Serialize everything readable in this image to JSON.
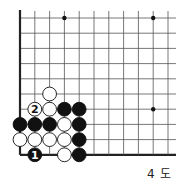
{
  "diagram": {
    "caption": "4 도",
    "board": {
      "columns": 11,
      "rows": 10,
      "origin_x": 20,
      "origin_y": 18,
      "step_x": 14.8,
      "step_y": 15.2,
      "left_edge": true,
      "bottom_edge": true,
      "line_color": "#555555",
      "edge_color": "#222222"
    },
    "hoshi": [
      {
        "col": 3,
        "row": 0
      },
      {
        "col": 9,
        "row": 0
      },
      {
        "col": 9,
        "row": 6
      }
    ],
    "stones": [
      {
        "color": "white",
        "col": 2,
        "row": 5,
        "label": ""
      },
      {
        "color": "white",
        "col": 1,
        "row": 6,
        "label": "2"
      },
      {
        "color": "white",
        "col": 2,
        "row": 6,
        "label": ""
      },
      {
        "color": "black",
        "col": 3,
        "row": 6,
        "label": ""
      },
      {
        "color": "black",
        "col": 4,
        "row": 6,
        "label": ""
      },
      {
        "color": "black",
        "col": 0,
        "row": 7,
        "label": ""
      },
      {
        "color": "black",
        "col": 1,
        "row": 7,
        "label": ""
      },
      {
        "color": "black",
        "col": 2,
        "row": 7,
        "label": ""
      },
      {
        "color": "white",
        "col": 3,
        "row": 7,
        "label": ""
      },
      {
        "color": "black",
        "col": 4,
        "row": 7,
        "label": ""
      },
      {
        "color": "white",
        "col": 0,
        "row": 8,
        "label": ""
      },
      {
        "color": "white",
        "col": 1,
        "row": 8,
        "label": ""
      },
      {
        "color": "white",
        "col": 2,
        "row": 8,
        "label": ""
      },
      {
        "color": "white",
        "col": 3,
        "row": 8,
        "label": ""
      },
      {
        "color": "black",
        "col": 4,
        "row": 8,
        "label": ""
      },
      {
        "color": "black",
        "col": 1,
        "row": 9,
        "label": "1"
      },
      {
        "color": "white",
        "col": 3,
        "row": 9,
        "label": ""
      },
      {
        "color": "black",
        "col": 4,
        "row": 9,
        "label": ""
      }
    ]
  }
}
